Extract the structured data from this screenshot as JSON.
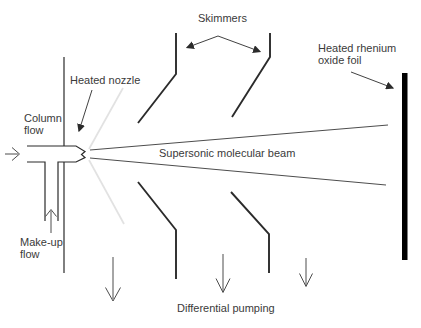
{
  "labels": {
    "skimmers": "Skimmers",
    "heated_rhenium": {
      "line1": "Heated rhenium",
      "line2": "oxide foil"
    },
    "heated_nozzle": "Heated nozzle",
    "column_flow": {
      "line1": "Column",
      "line2": "flow"
    },
    "supersonic_beam": "Supersonic molecular beam",
    "makeup_flow": {
      "line1": "Make-up",
      "line2": "flow"
    },
    "differential_pumping": "Differential pumping"
  },
  "colors": {
    "background": "#ffffff",
    "line": "#2b2b2b",
    "text": "#3a3a3a",
    "thin_line": "#4d4d4d",
    "expansion": "#e2e2e2",
    "foil": "#000000"
  }
}
